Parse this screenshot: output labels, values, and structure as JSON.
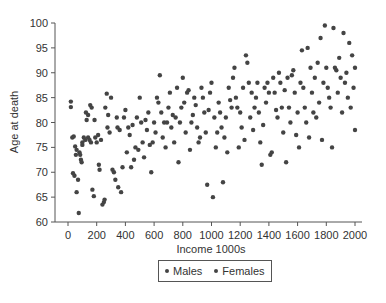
{
  "chart_data": {
    "type": "scatter",
    "title": "",
    "xlabel": "Income 1000s",
    "ylabel": "Age at death",
    "xlim": [
      0,
      2000
    ],
    "ylim": [
      60,
      100
    ],
    "xticks": [
      0,
      200,
      400,
      600,
      800,
      1000,
      1200,
      1400,
      1600,
      1800,
      2000
    ],
    "yticks": [
      60,
      65,
      70,
      75,
      80,
      85,
      90,
      95,
      100
    ],
    "grid": false,
    "legend_position": "bottom-center",
    "legend": [
      "Males",
      "Females"
    ],
    "marker_color": "#444444",
    "series": [
      {
        "name": "Males & Females (combined, not visually distinguishable)",
        "points": [
          [
            20,
            84.2
          ],
          [
            20,
            83.1
          ],
          [
            30,
            77
          ],
          [
            35,
            69.8
          ],
          [
            45,
            69.3
          ],
          [
            50,
            75.2
          ],
          [
            40,
            77.2
          ],
          [
            55,
            73.5
          ],
          [
            60,
            74.5
          ],
          [
            60,
            66
          ],
          [
            70,
            68.5
          ],
          [
            75,
            61.8
          ],
          [
            80,
            74
          ],
          [
            85,
            73.5
          ],
          [
            90,
            72.5
          ],
          [
            95,
            72
          ],
          [
            100,
            75.5
          ],
          [
            100,
            76
          ],
          [
            110,
            77
          ],
          [
            120,
            76.5
          ],
          [
            125,
            82
          ],
          [
            130,
            80.5
          ],
          [
            140,
            81.5
          ],
          [
            140,
            77
          ],
          [
            150,
            76.5
          ],
          [
            155,
            83.5
          ],
          [
            160,
            76
          ],
          [
            165,
            83
          ],
          [
            170,
            66.5
          ],
          [
            180,
            65.2
          ],
          [
            185,
            80.5
          ],
          [
            190,
            77
          ],
          [
            200,
            76
          ],
          [
            210,
            77.5
          ],
          [
            215,
            71.5
          ],
          [
            220,
            70.5
          ],
          [
            230,
            76.5
          ],
          [
            240,
            63.5
          ],
          [
            250,
            64
          ],
          [
            255,
            64.5
          ],
          [
            260,
            83
          ],
          [
            270,
            85.8
          ],
          [
            275,
            79
          ],
          [
            280,
            81.5
          ],
          [
            290,
            78
          ],
          [
            300,
            85
          ],
          [
            310,
            70.5
          ],
          [
            320,
            70
          ],
          [
            330,
            68.5
          ],
          [
            340,
            81
          ],
          [
            345,
            79
          ],
          [
            350,
            67
          ],
          [
            360,
            78.5
          ],
          [
            370,
            66
          ],
          [
            380,
            71
          ],
          [
            390,
            81
          ],
          [
            400,
            82.5
          ],
          [
            410,
            74
          ],
          [
            420,
            79
          ],
          [
            430,
            77.5
          ],
          [
            440,
            71
          ],
          [
            450,
            79.5
          ],
          [
            460,
            72.5
          ],
          [
            470,
            75
          ],
          [
            480,
            81
          ],
          [
            490,
            74.5
          ],
          [
            500,
            85
          ],
          [
            510,
            80
          ],
          [
            520,
            76
          ],
          [
            530,
            73
          ],
          [
            540,
            80.5
          ],
          [
            550,
            78.5
          ],
          [
            560,
            82
          ],
          [
            570,
            75.5
          ],
          [
            580,
            70
          ],
          [
            590,
            76
          ],
          [
            600,
            80
          ],
          [
            610,
            78
          ],
          [
            620,
            85
          ],
          [
            630,
            84
          ],
          [
            640,
            89.5
          ],
          [
            650,
            82
          ],
          [
            660,
            77
          ],
          [
            670,
            80
          ],
          [
            680,
            75
          ],
          [
            690,
            80
          ],
          [
            700,
            83
          ],
          [
            710,
            86
          ],
          [
            720,
            79
          ],
          [
            730,
            81.5
          ],
          [
            740,
            76
          ],
          [
            750,
            81
          ],
          [
            760,
            87
          ],
          [
            770,
            72
          ],
          [
            780,
            80
          ],
          [
            790,
            83
          ],
          [
            800,
            89
          ],
          [
            810,
            84
          ],
          [
            820,
            78
          ],
          [
            830,
            86
          ],
          [
            840,
            86.5
          ],
          [
            850,
            74.5
          ],
          [
            860,
            80
          ],
          [
            870,
            81.5
          ],
          [
            880,
            85
          ],
          [
            890,
            83.5
          ],
          [
            900,
            79
          ],
          [
            910,
            76
          ],
          [
            920,
            77
          ],
          [
            930,
            87
          ],
          [
            940,
            85
          ],
          [
            950,
            82
          ],
          [
            960,
            78
          ],
          [
            970,
            67.5
          ],
          [
            980,
            82.5
          ],
          [
            990,
            86
          ],
          [
            1000,
            88
          ],
          [
            1010,
            65
          ],
          [
            1020,
            81
          ],
          [
            1030,
            75
          ],
          [
            1040,
            78
          ],
          [
            1050,
            84
          ],
          [
            1060,
            82
          ],
          [
            1070,
            79
          ],
          [
            1080,
            68
          ],
          [
            1090,
            77
          ],
          [
            1100,
            81
          ],
          [
            1110,
            74
          ],
          [
            1120,
            87
          ],
          [
            1130,
            84.5
          ],
          [
            1140,
            83
          ],
          [
            1150,
            89
          ],
          [
            1160,
            91
          ],
          [
            1170,
            85
          ],
          [
            1180,
            83
          ],
          [
            1190,
            75
          ],
          [
            1200,
            82
          ],
          [
            1210,
            79
          ],
          [
            1220,
            87
          ],
          [
            1230,
            76.5
          ],
          [
            1240,
            93.5
          ],
          [
            1250,
            92
          ],
          [
            1260,
            88
          ],
          [
            1270,
            81
          ],
          [
            1280,
            86
          ],
          [
            1290,
            78.5
          ],
          [
            1300,
            83
          ],
          [
            1310,
            85
          ],
          [
            1320,
            88
          ],
          [
            1330,
            82
          ],
          [
            1340,
            76
          ],
          [
            1350,
            71.5
          ],
          [
            1360,
            79.5
          ],
          [
            1370,
            87
          ],
          [
            1380,
            84
          ],
          [
            1390,
            88
          ],
          [
            1400,
            86
          ],
          [
            1410,
            73.5
          ],
          [
            1420,
            74
          ],
          [
            1430,
            89
          ],
          [
            1440,
            86
          ],
          [
            1450,
            82.5
          ],
          [
            1460,
            81
          ],
          [
            1470,
            90
          ],
          [
            1480,
            88
          ],
          [
            1490,
            83
          ],
          [
            1500,
            78
          ],
          [
            1510,
            86.5
          ],
          [
            1520,
            72
          ],
          [
            1530,
            89
          ],
          [
            1540,
            83
          ],
          [
            1550,
            80
          ],
          [
            1560,
            89.5
          ],
          [
            1570,
            90.5
          ],
          [
            1580,
            86
          ],
          [
            1590,
            77.5
          ],
          [
            1600,
            82
          ],
          [
            1610,
            75
          ],
          [
            1620,
            88
          ],
          [
            1630,
            94.5
          ],
          [
            1640,
            87
          ],
          [
            1650,
            83
          ],
          [
            1660,
            80
          ],
          [
            1670,
            95
          ],
          [
            1680,
            77
          ],
          [
            1690,
            91
          ],
          [
            1700,
            86
          ],
          [
            1710,
            82
          ],
          [
            1720,
            89
          ],
          [
            1730,
            81
          ],
          [
            1740,
            92
          ],
          [
            1750,
            84
          ],
          [
            1760,
            97
          ],
          [
            1770,
            76.5
          ],
          [
            1780,
            88
          ],
          [
            1790,
            99.5
          ],
          [
            1800,
            91
          ],
          [
            1810,
            87
          ],
          [
            1820,
            85
          ],
          [
            1830,
            83
          ],
          [
            1840,
            75
          ],
          [
            1850,
            99
          ],
          [
            1860,
            91
          ],
          [
            1870,
            90.5
          ],
          [
            1880,
            86
          ],
          [
            1890,
            93
          ],
          [
            1900,
            89
          ],
          [
            1910,
            82
          ],
          [
            1920,
            98
          ],
          [
            1930,
            88
          ],
          [
            1940,
            90
          ],
          [
            1950,
            85
          ],
          [
            1960,
            96
          ],
          [
            1970,
            83
          ],
          [
            1980,
            93.5
          ],
          [
            1990,
            87
          ],
          [
            2000,
            91
          ],
          [
            2000,
            78.5
          ]
        ]
      }
    ]
  },
  "axes": {
    "x_label": "Income 1000s",
    "y_label": "Age at death",
    "x_ticks": [
      "0",
      "200",
      "400",
      "600",
      "800",
      "1000",
      "1200",
      "1400",
      "1600",
      "1800",
      "2000"
    ],
    "y_ticks": [
      "60",
      "65",
      "70",
      "75",
      "80",
      "85",
      "90",
      "95",
      "100"
    ]
  },
  "legend": {
    "items": [
      {
        "label": "Males"
      },
      {
        "label": "Females"
      }
    ]
  }
}
